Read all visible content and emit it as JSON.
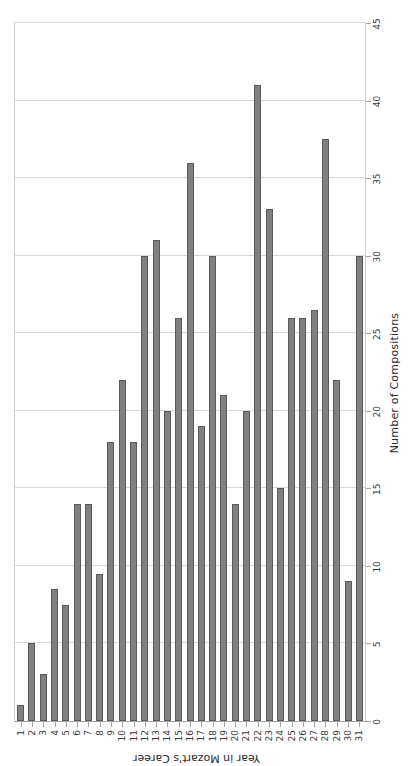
{
  "chart_data": {
    "type": "bar",
    "orientation": "horizontal",
    "title": "",
    "xlabel": "Number of Compositions",
    "ylabel": "Year in Mozart's Career",
    "categories": [
      "1",
      "2",
      "3",
      "4",
      "5",
      "6",
      "7",
      "8",
      "9",
      "10",
      "11",
      "12",
      "13",
      "14",
      "15",
      "16",
      "17",
      "18",
      "19",
      "20",
      "21",
      "22",
      "23",
      "24",
      "25",
      "26",
      "27",
      "28",
      "29",
      "30",
      "31"
    ],
    "values": [
      1,
      5,
      3,
      8.5,
      7.5,
      14,
      14,
      9.5,
      18,
      22,
      18,
      30,
      31,
      20,
      26,
      36,
      19,
      30,
      21,
      14,
      20,
      41,
      33,
      15,
      26,
      26,
      26.5,
      37.5,
      22,
      9,
      30
    ],
    "value_axis_ticks": [
      0,
      5,
      10,
      15,
      20,
      25,
      30,
      35,
      40,
      45
    ],
    "xlim": [
      0,
      45
    ],
    "grid": true,
    "legend": false,
    "bar_color": "#808080",
    "bar_border_color": "#595959",
    "grid_color": "#d9d9d9",
    "frame_color": "#cfcfcf",
    "rotation_note": "figure printed upside down / sideways on page"
  }
}
